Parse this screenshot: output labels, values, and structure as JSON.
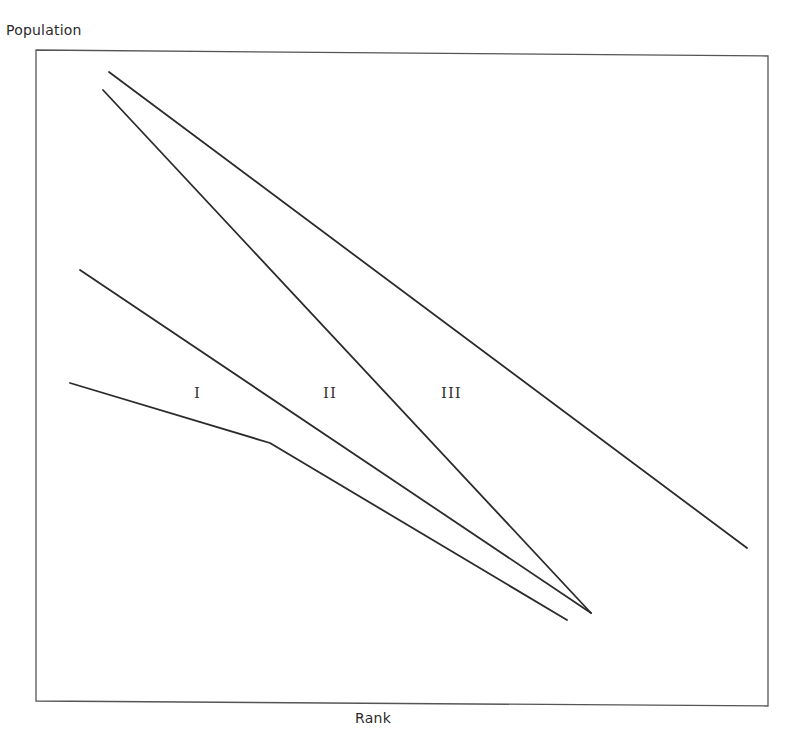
{
  "chart_data": {
    "type": "line",
    "title": "",
    "xlabel": "Rank",
    "ylabel": "Population",
    "grid": false,
    "legend": null,
    "axis_ticks": "none (schematic diagram, unlabeled axes)",
    "annotations": [
      {
        "text": "I",
        "x": 198,
        "y": 395
      },
      {
        "text": "II",
        "x": 332,
        "y": 395
      },
      {
        "text": "III",
        "x": 454,
        "y": 395
      }
    ],
    "series": [
      {
        "name": "line-1 (upper, shallow)",
        "points": [
          [
            109,
            72
          ],
          [
            747,
            548
          ]
        ]
      },
      {
        "name": "line-2 (steep)",
        "points": [
          [
            103,
            90
          ],
          [
            591,
            613
          ]
        ]
      },
      {
        "name": "line-3 (middle)",
        "points": [
          [
            80,
            270
          ],
          [
            591,
            613
          ]
        ]
      },
      {
        "name": "line-4 (lower, kinked)",
        "points": [
          [
            70,
            383
          ],
          [
            270,
            443
          ],
          [
            567,
            620
          ]
        ]
      }
    ],
    "frame": {
      "left": 36,
      "top": 50,
      "right": 768,
      "bottom": 704
    },
    "line_color": "#2b2b2b"
  },
  "labels": {
    "y_axis": "Population",
    "x_axis": "Rank",
    "region_1": "I",
    "region_2": "II",
    "region_3": "III"
  }
}
